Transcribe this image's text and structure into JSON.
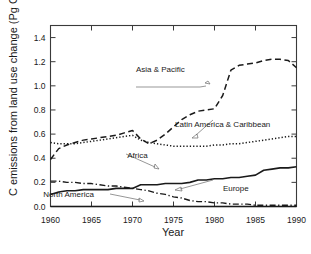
{
  "chart_data": {
    "type": "line",
    "title": "",
    "xlabel": "Year",
    "ylabel": "C emissions from land use change (Pg C y",
    "ylabel_sup": "-1",
    "ylabel_tail": ")",
    "xlim": [
      1960,
      1990
    ],
    "ylim": [
      0.0,
      1.5
    ],
    "grid": false,
    "legend": "inline-annotations",
    "xticks": [
      "1960",
      "1965",
      "1970",
      "1975",
      "1980",
      "1985",
      "1990"
    ],
    "xtick_values": [
      1960,
      1965,
      1970,
      1975,
      1980,
      1985,
      1990
    ],
    "yticks": [
      "0.0",
      "0.2",
      "0.4",
      "0.6",
      "0.8",
      "1.0",
      "1.2",
      "1.4"
    ],
    "ytick_values": [
      0.0,
      0.2,
      0.4,
      0.6,
      0.8,
      1.0,
      1.2,
      1.4
    ],
    "x": [
      1960,
      1961,
      1962,
      1963,
      1964,
      1965,
      1966,
      1967,
      1968,
      1969,
      1970,
      1971,
      1972,
      1973,
      1974,
      1975,
      1976,
      1977,
      1978,
      1979,
      1980,
      1981,
      1982,
      1983,
      1984,
      1985,
      1986,
      1987,
      1988,
      1989,
      1990
    ],
    "series": [
      {
        "name": "Asia & Pacific",
        "style": "dashed",
        "values": [
          0.39,
          0.48,
          0.51,
          0.53,
          0.55,
          0.56,
          0.57,
          0.58,
          0.59,
          0.61,
          0.63,
          0.56,
          0.52,
          0.55,
          0.6,
          0.66,
          0.72,
          0.76,
          0.79,
          0.8,
          0.81,
          0.92,
          1.13,
          1.17,
          1.18,
          1.19,
          1.21,
          1.22,
          1.22,
          1.21,
          1.15
        ]
      },
      {
        "name": "Latin America &  Caribbean",
        "style": "dotted",
        "values": [
          0.53,
          0.52,
          0.52,
          0.52,
          0.53,
          0.54,
          0.55,
          0.56,
          0.57,
          0.58,
          0.59,
          0.55,
          0.53,
          0.52,
          0.51,
          0.5,
          0.5,
          0.5,
          0.5,
          0.5,
          0.51,
          0.51,
          0.52,
          0.52,
          0.53,
          0.54,
          0.55,
          0.56,
          0.57,
          0.58,
          0.58
        ]
      },
      {
        "name": "Africa",
        "style": "solid",
        "values": [
          0.1,
          0.12,
          0.13,
          0.13,
          0.14,
          0.14,
          0.14,
          0.14,
          0.15,
          0.15,
          0.15,
          0.18,
          0.18,
          0.18,
          0.19,
          0.19,
          0.19,
          0.2,
          0.22,
          0.22,
          0.23,
          0.23,
          0.24,
          0.24,
          0.25,
          0.26,
          0.3,
          0.31,
          0.32,
          0.32,
          0.33
        ]
      },
      {
        "name": "Europe",
        "style": "dash-dot",
        "values": [
          0.21,
          0.21,
          0.2,
          0.2,
          0.19,
          0.19,
          0.18,
          0.17,
          0.17,
          0.16,
          0.15,
          0.14,
          0.13,
          0.11,
          0.1,
          0.08,
          0.07,
          0.05,
          0.04,
          0.04,
          0.03,
          0.03,
          0.02,
          0.02,
          0.02,
          0.01,
          0.01,
          0.01,
          0.01,
          0.01,
          0.01
        ]
      },
      {
        "name": "North America",
        "style": "solid-gray",
        "values": [
          0.0,
          0.0,
          0.0,
          0.0,
          0.0,
          0.0,
          0.0,
          0.0,
          0.0,
          0.0,
          0.0,
          0.0,
          0.0,
          0.0,
          0.0,
          0.0,
          0.0,
          0.0,
          0.0,
          0.0,
          0.0,
          0.0,
          0.0,
          0.0,
          0.0,
          0.0,
          0.0,
          0.0,
          0.0,
          0.0,
          0.0
        ]
      }
    ],
    "annotations": [
      {
        "text": "Asia & Pacific",
        "x": 1973.4,
        "y": 1.115
      },
      {
        "text": "Latin America &  Caribbean",
        "x": 1981.0,
        "y": 0.655
      },
      {
        "text": "Africa",
        "x": 1970.6,
        "y": 0.405
      },
      {
        "text": "Europe",
        "x": 1982.6,
        "y": 0.125
      },
      {
        "text": "North America",
        "x": 1962.2,
        "y": 0.075
      }
    ]
  }
}
